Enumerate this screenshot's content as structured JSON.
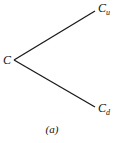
{
  "diagram": {
    "type": "binomial-tree-one-step",
    "root": {
      "label": "C"
    },
    "up": {
      "label": "C",
      "subscript": "u"
    },
    "down": {
      "label": "C",
      "subscript": "d"
    },
    "caption": "(a)",
    "line_color": "#1a1a1a"
  }
}
